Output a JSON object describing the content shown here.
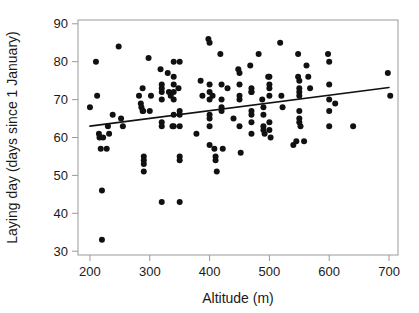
{
  "chart_data": {
    "type": "scatter",
    "title": "",
    "xlabel": "Altitude (m)",
    "ylabel": "Laying day (days since 1 January)",
    "xlim": [
      180,
      715
    ],
    "ylim": [
      29,
      91
    ],
    "xticks": [
      200,
      300,
      400,
      500,
      600,
      700
    ],
    "yticks": [
      30,
      40,
      50,
      60,
      70,
      80,
      90
    ],
    "grid": false,
    "legend": null,
    "point_color": "#111111",
    "line_color": "#111111",
    "axis_color": "#9a9a9a",
    "marker": "filled-circle",
    "marker_size_px": 3,
    "trendline": {
      "label": "linear regression fit",
      "x": [
        200,
        700
      ],
      "y": [
        63.0,
        73.2
      ],
      "slope_per_m": 0.0204,
      "intercept": 58.92
    },
    "points": [
      [
        200,
        68
      ],
      [
        210,
        80
      ],
      [
        212,
        71
      ],
      [
        215,
        61
      ],
      [
        216,
        60
      ],
      [
        218,
        57
      ],
      [
        220,
        46
      ],
      [
        220,
        33
      ],
      [
        222,
        60
      ],
      [
        228,
        57
      ],
      [
        230,
        63
      ],
      [
        232,
        61
      ],
      [
        238,
        66
      ],
      [
        248,
        84
      ],
      [
        252,
        65
      ],
      [
        255,
        63
      ],
      [
        282,
        71
      ],
      [
        285,
        69
      ],
      [
        286,
        68
      ],
      [
        288,
        73
      ],
      [
        288,
        67
      ],
      [
        289,
        67
      ],
      [
        290,
        54
      ],
      [
        290,
        53
      ],
      [
        290,
        55
      ],
      [
        290,
        51
      ],
      [
        298,
        81
      ],
      [
        300,
        67
      ],
      [
        302,
        71
      ],
      [
        318,
        78
      ],
      [
        320,
        74
      ],
      [
        320,
        73
      ],
      [
        320,
        72
      ],
      [
        320,
        70
      ],
      [
        320,
        64
      ],
      [
        320,
        63
      ],
      [
        320,
        43
      ],
      [
        330,
        77
      ],
      [
        332,
        72
      ],
      [
        335,
        71
      ],
      [
        338,
        63
      ],
      [
        340,
        80
      ],
      [
        340,
        76
      ],
      [
        340,
        74
      ],
      [
        340,
        72
      ],
      [
        340,
        70
      ],
      [
        340,
        66
      ],
      [
        340,
        63
      ],
      [
        348,
        73
      ],
      [
        350,
        80
      ],
      [
        350,
        67
      ],
      [
        350,
        66
      ],
      [
        350,
        63
      ],
      [
        350,
        55
      ],
      [
        350,
        54
      ],
      [
        350,
        43
      ],
      [
        378,
        61
      ],
      [
        385,
        75
      ],
      [
        388,
        71
      ],
      [
        398,
        86
      ],
      [
        400,
        85
      ],
      [
        400,
        74
      ],
      [
        400,
        72
      ],
      [
        400,
        70
      ],
      [
        400,
        66
      ],
      [
        400,
        65
      ],
      [
        400,
        63
      ],
      [
        400,
        58
      ],
      [
        405,
        71
      ],
      [
        408,
        57
      ],
      [
        410,
        55
      ],
      [
        410,
        54
      ],
      [
        412,
        51
      ],
      [
        418,
        82
      ],
      [
        420,
        74
      ],
      [
        420,
        70
      ],
      [
        420,
        68
      ],
      [
        420,
        67
      ],
      [
        422,
        57
      ],
      [
        430,
        73
      ],
      [
        440,
        65
      ],
      [
        448,
        78
      ],
      [
        450,
        77
      ],
      [
        450,
        74
      ],
      [
        450,
        71
      ],
      [
        450,
        70
      ],
      [
        450,
        63
      ],
      [
        452,
        56
      ],
      [
        468,
        79
      ],
      [
        470,
        73
      ],
      [
        470,
        72
      ],
      [
        470,
        72
      ],
      [
        470,
        67
      ],
      [
        470,
        66
      ],
      [
        470,
        64
      ],
      [
        470,
        61
      ],
      [
        482,
        82
      ],
      [
        488,
        70
      ],
      [
        490,
        68
      ],
      [
        490,
        66
      ],
      [
        490,
        63
      ],
      [
        490,
        62
      ],
      [
        492,
        61
      ],
      [
        498,
        76
      ],
      [
        500,
        76
      ],
      [
        500,
        74
      ],
      [
        500,
        73
      ],
      [
        500,
        71
      ],
      [
        500,
        64
      ],
      [
        500,
        62
      ],
      [
        502,
        60
      ],
      [
        518,
        85
      ],
      [
        520,
        71
      ],
      [
        522,
        68
      ],
      [
        540,
        58
      ],
      [
        545,
        59
      ],
      [
        548,
        82
      ],
      [
        548,
        76
      ],
      [
        550,
        75
      ],
      [
        550,
        73
      ],
      [
        550,
        72
      ],
      [
        550,
        71
      ],
      [
        550,
        67
      ],
      [
        550,
        65
      ],
      [
        550,
        64
      ],
      [
        552,
        63
      ],
      [
        558,
        59
      ],
      [
        562,
        79
      ],
      [
        565,
        76
      ],
      [
        568,
        73
      ],
      [
        598,
        82
      ],
      [
        600,
        80
      ],
      [
        600,
        74
      ],
      [
        600,
        70
      ],
      [
        600,
        67
      ],
      [
        600,
        63
      ],
      [
        610,
        69
      ],
      [
        640,
        63
      ],
      [
        698,
        77
      ],
      [
        702,
        71
      ]
    ]
  },
  "axes": {
    "y_tick_labels": [
      "30",
      "40",
      "50",
      "60",
      "70",
      "80",
      "90"
    ],
    "x_tick_labels": [
      "200",
      "300",
      "400",
      "500",
      "600",
      "700"
    ]
  }
}
